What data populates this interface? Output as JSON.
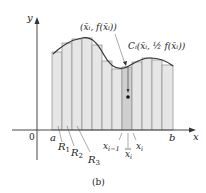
{
  "figure": {
    "caption": "(b)",
    "axes": {
      "x_label": "x",
      "y_label": "y",
      "origin_label": "0"
    },
    "interval": {
      "start_label": "a",
      "end_label": "b"
    },
    "region_labels": [
      "R",
      "R",
      "R"
    ],
    "region_subscripts": [
      "1",
      "2",
      "3"
    ],
    "partition_labels": {
      "left": "x",
      "left_sub": "i−1",
      "mid": "x",
      "mid_sub": "i",
      "right": "x",
      "right_sub": "i"
    },
    "point_top_label": "(x̄ᵢ, f(x̄ᵢ))",
    "centroid_label": "Cᵢ(x̄ᵢ, ½ f(x̄ᵢ))",
    "colors": {
      "strip_fill": "#e6e6e6",
      "highlight_fill": "#cfcfcf",
      "strip_stroke": "#8a8a8a",
      "curve": "#333333",
      "axis": "#333333"
    },
    "strip_count": 12,
    "highlighted_strip_index": 7
  }
}
